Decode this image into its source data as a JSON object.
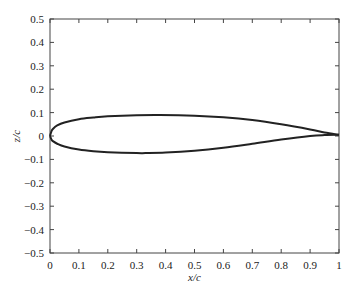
{
  "chart_data": {
    "type": "line",
    "title": "",
    "xlabel": "x/c",
    "ylabel": "z/c",
    "xlim": [
      0,
      1
    ],
    "ylim": [
      -0.5,
      0.5
    ],
    "xticks": [
      "0",
      "0.1",
      "0.2",
      "0.3",
      "0.4",
      "0.5",
      "0.6",
      "0.7",
      "0.8",
      "0.9",
      "1"
    ],
    "yticks": [
      "0.5",
      "0.4",
      "0.3",
      "0.2",
      "0.1",
      "0",
      "−0.1",
      "−0.2",
      "−0.3",
      "−0.4",
      "−0.5"
    ],
    "grid": false,
    "series": [
      {
        "name": "upper surface",
        "x": [
          0,
          0.005,
          0.01,
          0.025,
          0.05,
          0.1,
          0.15,
          0.2,
          0.3,
          0.38,
          0.5,
          0.6,
          0.7,
          0.8,
          0.9,
          0.95,
          1.0
        ],
        "y": [
          0,
          0.02,
          0.03,
          0.045,
          0.058,
          0.072,
          0.079,
          0.084,
          0.089,
          0.09,
          0.087,
          0.08,
          0.068,
          0.05,
          0.028,
          0.015,
          0.005
        ]
      },
      {
        "name": "lower surface",
        "x": [
          0,
          0.005,
          0.01,
          0.025,
          0.05,
          0.1,
          0.15,
          0.2,
          0.3,
          0.33,
          0.4,
          0.5,
          0.6,
          0.7,
          0.8,
          0.9,
          0.95,
          1.0
        ],
        "y": [
          0,
          -0.015,
          -0.022,
          -0.033,
          -0.045,
          -0.058,
          -0.065,
          -0.069,
          -0.073,
          -0.073,
          -0.071,
          -0.063,
          -0.05,
          -0.033,
          -0.015,
          0.0,
          0.004,
          0.005
        ]
      }
    ]
  }
}
